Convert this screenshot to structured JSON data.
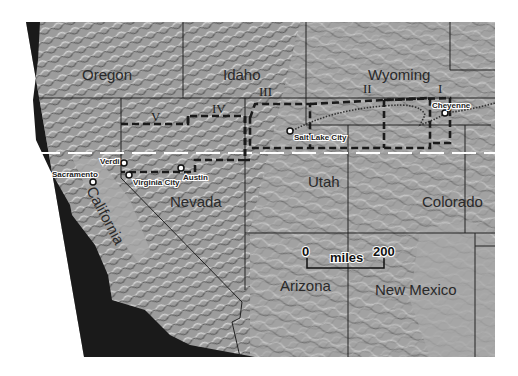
{
  "map": {
    "type": "shaded-relief",
    "colors": {
      "background": "#ffffff",
      "terrain": "#9a9a9a",
      "ocean": "#1a1a1a",
      "boundary": "#222222",
      "parallel": "#ffffff"
    },
    "states": [
      {
        "name": "Oregon"
      },
      {
        "name": "Idaho"
      },
      {
        "name": "Wyoming"
      },
      {
        "name": "California"
      },
      {
        "name": "Nevada"
      },
      {
        "name": "Utah"
      },
      {
        "name": "Colorado"
      },
      {
        "name": "Arizona"
      },
      {
        "name": "New Mexico"
      }
    ],
    "cities": [
      {
        "name": "Sacramento"
      },
      {
        "name": "Verdi"
      },
      {
        "name": "Virginia City"
      },
      {
        "name": "Austin"
      },
      {
        "name": "Salt Lake City"
      },
      {
        "name": "Cheyenne"
      }
    ],
    "regions": [
      "I",
      "II",
      "III",
      "IV",
      "V"
    ],
    "scale_bar": {
      "start": "0",
      "end": "200",
      "unit": "miles"
    }
  }
}
